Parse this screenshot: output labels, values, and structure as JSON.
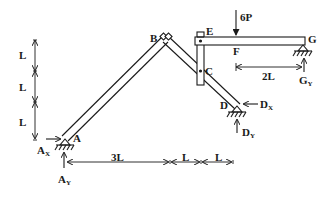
{
  "diagram": {
    "type": "structural-frame",
    "colors": {
      "ink": "#1a1a1a",
      "background": "#ffffff"
    },
    "points": {
      "A": {
        "label": "A"
      },
      "B": {
        "label": "B"
      },
      "C": {
        "label": "C"
      },
      "D": {
        "label": "D"
      },
      "E": {
        "label": "E"
      },
      "F": {
        "label": "F"
      },
      "G": {
        "label": "G"
      }
    },
    "load": {
      "label": "6P",
      "at": "F",
      "direction": "down"
    },
    "reactions": {
      "Ax": {
        "main": "A",
        "sub": "X"
      },
      "Ay": {
        "main": "A",
        "sub": "Y"
      },
      "Dx": {
        "main": "D",
        "sub": "X"
      },
      "Dy": {
        "main": "D",
        "sub": "Y"
      },
      "Gy": {
        "main": "G",
        "sub": "Y"
      }
    },
    "dimensions": {
      "vertical": [
        "L",
        "L",
        "L"
      ],
      "horizontal": [
        "3L",
        "L",
        "L"
      ],
      "beam": "2L"
    }
  }
}
